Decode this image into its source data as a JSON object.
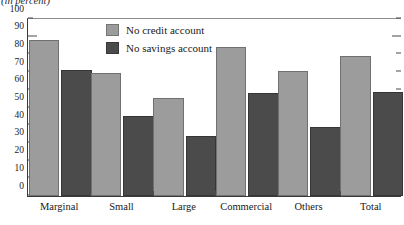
{
  "unit_note": "(in percent)",
  "legend": {
    "position": "inside-top-left",
    "entries": [
      {
        "label": "No credit account",
        "color": "#9c9c9c",
        "swatch_name": "legend-swatch-no-credit-account"
      },
      {
        "label": "No savings account",
        "color": "#4b4b4b",
        "swatch_name": "legend-swatch-no-savings-account"
      }
    ]
  },
  "chart_data": {
    "type": "bar",
    "title": "",
    "subtitle": "",
    "xlabel": "",
    "ylabel": "(in percent)",
    "categories": [
      "Marginal",
      "Small",
      "Large",
      "Commercial",
      "Others",
      "Total"
    ],
    "series": [
      {
        "name": "No credit account",
        "color": "#9c9c9c",
        "values": [
          87,
          69,
          55,
          83,
          70,
          78.5
        ]
      },
      {
        "name": "No savings account",
        "color": "#4b4b4b",
        "values": [
          70.5,
          44.5,
          33.5,
          57.5,
          38.5,
          58
        ]
      }
    ],
    "ylim": [
      0,
      100
    ],
    "yticks": [
      0,
      10,
      20,
      30,
      40,
      50,
      60,
      70,
      80,
      90,
      100
    ],
    "ytick_labels": [
      "0",
      "10",
      "20",
      "30",
      "40",
      "50",
      "60",
      "70",
      "80",
      "90",
      "100"
    ],
    "grid": false,
    "legend_position": "inside-top-left"
  }
}
